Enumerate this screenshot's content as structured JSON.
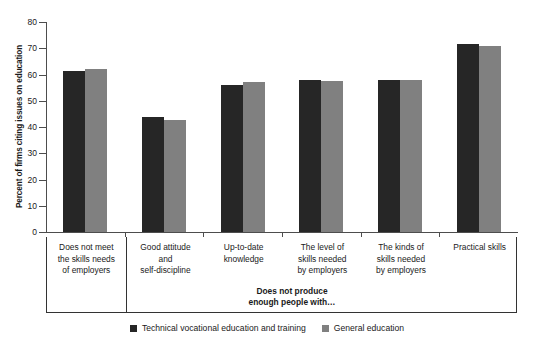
{
  "chart_data": {
    "type": "bar",
    "title": "",
    "xlabel": "Does not produce enough people with…",
    "ylabel": "Percent of firms citing issues on education",
    "ylim": [
      0,
      80
    ],
    "yticks": [
      0,
      10,
      20,
      30,
      40,
      50,
      60,
      70,
      80
    ],
    "grid": false,
    "legend_position": "bottom",
    "categories": [
      "Does not meet\nthe skills needs\nof employers",
      "Good attitude\nand\nself-discipline",
      "Up-to-date\nknowledge",
      "The level of\nskills needed\nby employers",
      "The kinds of\nskills needed\nby employers",
      "Practical skills"
    ],
    "series": [
      {
        "name": "Technical vocational education and training",
        "color": "#262626",
        "values": [
          61.5,
          44.0,
          56.0,
          58.0,
          58.0,
          71.5
        ]
      },
      {
        "name": "General education",
        "color": "#808080",
        "values": [
          62.0,
          42.5,
          57.0,
          57.5,
          58.0,
          71.0
        ]
      }
    ]
  },
  "axis": {
    "y_title": "Percent of firms citing issues on education",
    "sub_axis_label_line1": "Does not produce",
    "sub_axis_label_line2": "enough people with…"
  },
  "categories_lines": [
    [
      "Does not meet",
      "the skills needs",
      "of employers"
    ],
    [
      "Good attitude",
      "and",
      "self-discipline"
    ],
    [
      "Up-to-date",
      "knowledge"
    ],
    [
      "The level of",
      "skills needed",
      "by employers"
    ],
    [
      "The kinds of",
      "skills needed",
      "by employers"
    ],
    [
      "Practical skills"
    ]
  ],
  "legend": {
    "items": [
      {
        "label": "Technical vocational education and training"
      },
      {
        "label": "General education"
      }
    ]
  }
}
